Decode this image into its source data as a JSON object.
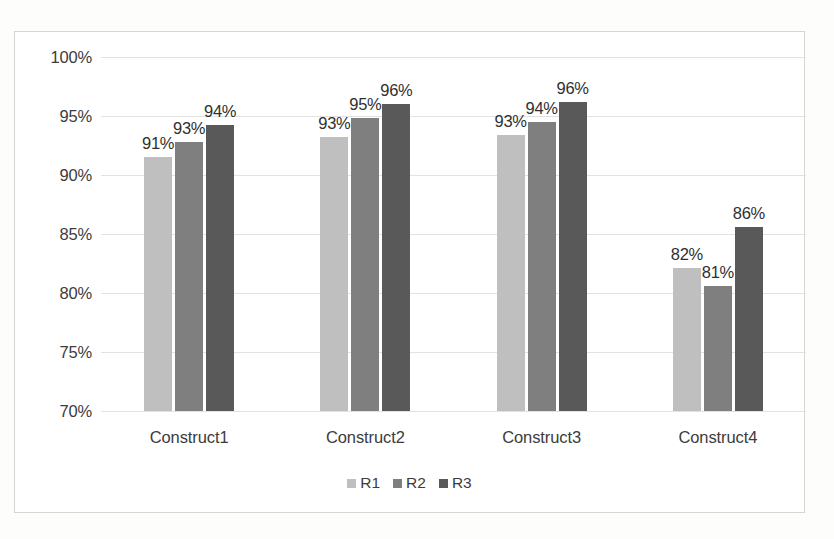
{
  "chart_data": {
    "type": "bar",
    "title": "",
    "xlabel": "",
    "ylabel": "",
    "ylim": [
      70,
      100
    ],
    "grid": true,
    "legend_position": "bottom",
    "categories": [
      "Construct1",
      "Construct2",
      "Construct3",
      "Construct4"
    ],
    "ytick_labels": [
      "100%",
      "95%",
      "90%",
      "85%",
      "80%",
      "75%",
      "70%"
    ],
    "ytick_values": [
      100,
      95,
      90,
      85,
      80,
      75,
      70
    ],
    "series": [
      {
        "name": "R1",
        "color": "#bfbfbf",
        "values": [
          91.5,
          93.2,
          93.4,
          82.1
        ],
        "labels": [
          "91%",
          "93%",
          "93%",
          "82%"
        ]
      },
      {
        "name": "R2",
        "color": "#7f7f7f",
        "values": [
          92.8,
          94.8,
          94.5,
          80.6
        ],
        "labels": [
          "93%",
          "95%",
          "94%",
          "81%"
        ]
      },
      {
        "name": "R3",
        "color": "#595959",
        "values": [
          94.2,
          96.0,
          96.2,
          85.6
        ],
        "labels": [
          "94%",
          "96%",
          "96%",
          "86%"
        ]
      }
    ]
  },
  "legend": {
    "items": [
      {
        "label": "R1"
      },
      {
        "label": "R2"
      },
      {
        "label": "R3"
      }
    ]
  },
  "caption": {
    "sliver": ""
  }
}
